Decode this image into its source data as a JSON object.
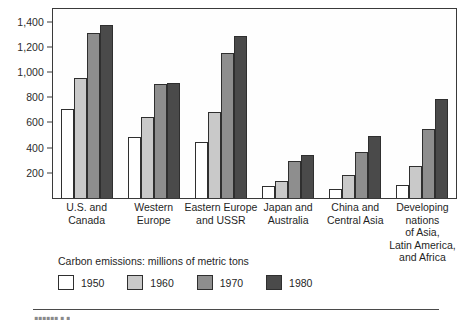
{
  "chart_data": {
    "type": "bar",
    "title": "",
    "subtitle": "",
    "xlabel": "",
    "ylabel": "",
    "legend_caption": "Carbon emissions: millions of metric tons",
    "legend_position": "bottom",
    "grid": false,
    "ylim": [
      0,
      1500
    ],
    "yticks": [
      200,
      400,
      600,
      800,
      1000,
      1200,
      1400
    ],
    "ytick_labels": [
      "200",
      "400",
      "600",
      "800",
      "1,000",
      "1,200",
      "1,400"
    ],
    "categories": [
      "U.S. and\nCanada",
      "Western\nEurope",
      "Eastern Europe\nand USSR",
      "Japan and\nAustralia",
      "China and\nCentral Asia",
      "Developing\nnations\nof Asia,\nLatin America,\nand Africa"
    ],
    "series": [
      {
        "name": "1950",
        "color": "#ffffff",
        "values": [
          710,
          485,
          445,
          95,
          75,
          105
        ]
      },
      {
        "name": "1960",
        "color": "#c9c9c9",
        "values": [
          950,
          640,
          680,
          135,
          185,
          255
        ]
      },
      {
        "name": "1970",
        "color": "#8e8e8e",
        "values": [
          1310,
          905,
          1150,
          295,
          365,
          545
        ]
      },
      {
        "name": "1980",
        "color": "#4a4a4a",
        "values": [
          1370,
          915,
          1285,
          340,
          495,
          785
        ]
      }
    ]
  },
  "footer": {
    "cut_text": "▮▮▮▮▮▮  ▮ ▮"
  }
}
